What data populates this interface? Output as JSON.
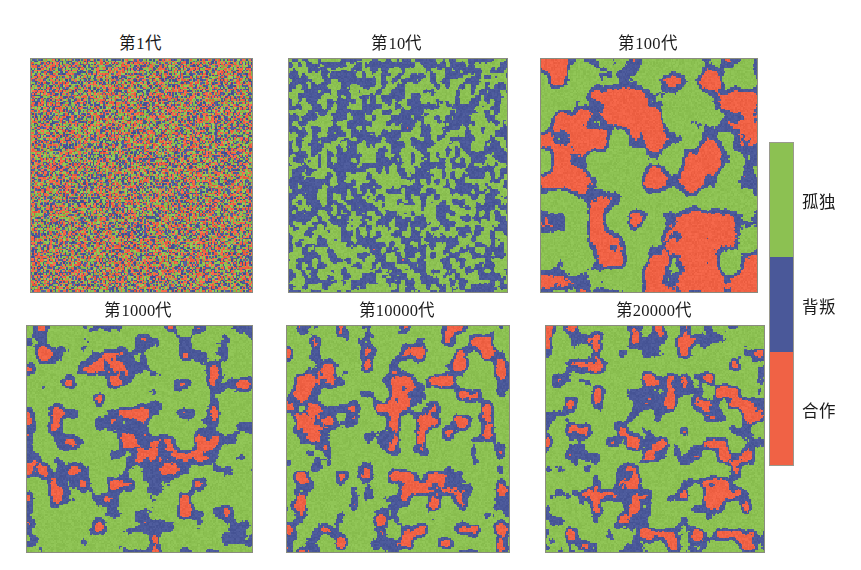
{
  "figure": {
    "type": "lattice-snapshot-grid",
    "width": 861,
    "height": 570,
    "background": "#ffffff",
    "grid": {
      "rows": 2,
      "cols": 3
    }
  },
  "colors": {
    "loner": "#8CC152",
    "defect": "#4A5899",
    "cooperate": "#F06245",
    "panel_border": "#8a8c80",
    "legend_border": "#9a9a8e",
    "text": "#1a1a1a"
  },
  "legend": {
    "name": "strategy-colorbar",
    "orientation": "vertical",
    "bands": [
      {
        "key": "loner",
        "label": "孤独",
        "color": "#8CC152",
        "fraction": 0.355
      },
      {
        "key": "defect",
        "label": "背叛",
        "color": "#4A5899",
        "fraction": 0.295
      },
      {
        "key": "cooperate",
        "label": "合作",
        "color": "#F06245",
        "fraction": 0.35
      }
    ]
  },
  "chart_data": {
    "type": "heatmap",
    "title": "",
    "xlabel": "",
    "ylabel": "",
    "categories": [
      "孤独",
      "背叛",
      "合作"
    ],
    "legend_position": "right",
    "grid": false,
    "panels": [
      {
        "id": "gen-1",
        "title": "第1代",
        "generation": 1,
        "row": 0,
        "col": 0,
        "x": 30,
        "y": 58,
        "w": 221,
        "h": 233,
        "title_x": 30,
        "title_y": 30,
        "pattern": "random-noise",
        "blob_scale": 1.0,
        "seed": 101,
        "fractions": {
          "loner": 0.33,
          "defect": 0.34,
          "cooperate": 0.33
        }
      },
      {
        "id": "gen-10",
        "title": "第10代",
        "generation": 10,
        "row": 0,
        "col": 1,
        "x": 288,
        "y": 58,
        "w": 218,
        "h": 233,
        "title_x": 288,
        "title_y": 30,
        "pattern": "fine-clusters",
        "blob_scale": 3.4,
        "seed": 202,
        "fractions": {
          "loner": 0.47,
          "defect": 0.4,
          "cooperate": 0.13
        }
      },
      {
        "id": "gen-100",
        "title": "第100代",
        "generation": 100,
        "row": 0,
        "col": 2,
        "x": 540,
        "y": 58,
        "w": 216,
        "h": 233,
        "title_x": 540,
        "title_y": 30,
        "pattern": "coarse-domains",
        "blob_scale": 13.0,
        "seed": 303,
        "fractions": {
          "loner": 0.44,
          "defect": 0.13,
          "cooperate": 0.43
        }
      },
      {
        "id": "gen-1000",
        "title": "第1000代",
        "generation": 1000,
        "row": 1,
        "col": 0,
        "x": 26,
        "y": 325,
        "w": 225,
        "h": 226,
        "title_x": 26,
        "title_y": 297,
        "pattern": "green-dominant-filaments",
        "blob_scale": 9.5,
        "seed": 404,
        "fractions": {
          "loner": 0.62,
          "defect": 0.14,
          "cooperate": 0.24
        }
      },
      {
        "id": "gen-10000",
        "title": "第10000代",
        "generation": 10000,
        "row": 1,
        "col": 1,
        "x": 286,
        "y": 325,
        "w": 222,
        "h": 226,
        "title_x": 286,
        "title_y": 297,
        "pattern": "green-dominant-filaments",
        "blob_scale": 9.0,
        "seed": 505,
        "fractions": {
          "loner": 0.58,
          "defect": 0.13,
          "cooperate": 0.29
        }
      },
      {
        "id": "gen-20000",
        "title": "第20000代",
        "generation": 20000,
        "row": 1,
        "col": 2,
        "x": 545,
        "y": 325,
        "w": 218,
        "h": 226,
        "title_x": 545,
        "title_y": 297,
        "pattern": "green-dominant-filaments",
        "blob_scale": 8.6,
        "seed": 606,
        "fractions": {
          "loner": 0.58,
          "defect": 0.13,
          "cooperate": 0.29
        }
      }
    ]
  }
}
